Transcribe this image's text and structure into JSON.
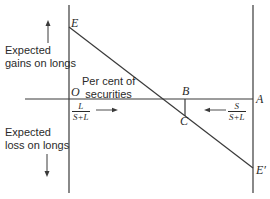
{
  "diagram": {
    "points": {
      "E": "E",
      "E_prime": "E′",
      "O": "O",
      "A": "A",
      "B": "B",
      "C": "C"
    },
    "labels": {
      "gains_line1": "Expected",
      "gains_line2": "gains on longs",
      "loss_line1": "Expected",
      "loss_line2": "loss on longs",
      "percent_line1": "Per cent of",
      "percent_line2": "securities"
    },
    "fractions": {
      "left": {
        "numerator": "L",
        "denominator": "S+L"
      },
      "right": {
        "numerator": "S",
        "denominator": "S+L"
      }
    },
    "colors": {
      "line": "#3a3a3a",
      "text": "#2a2a2a"
    }
  }
}
